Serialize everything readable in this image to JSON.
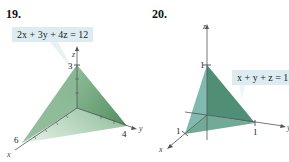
{
  "figures": [
    {
      "number": "19.",
      "equation": "2x + 3y + 4z = 12",
      "axes": {
        "x": "x",
        "y": "y",
        "z": "z"
      },
      "intercepts": {
        "x": "6",
        "y": "4",
        "z": "3"
      },
      "fill_color": "#7fae8a"
    },
    {
      "number": "20.",
      "equation": "x + y + z = 1",
      "axes": {
        "x": "x",
        "y": "y",
        "z": "z"
      },
      "intercepts": {
        "x": "1",
        "y": "1",
        "z": "1"
      },
      "fill_color": "#5f9e92"
    }
  ]
}
